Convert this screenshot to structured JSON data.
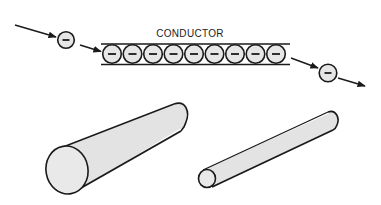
{
  "figure": {
    "label": "CONDUCTOR",
    "colors": {
      "background": "#ffffff",
      "stroke": "#1a1a1a",
      "electron_fill": "#e6e6e6",
      "cylinder_fill": "#e3e3e3",
      "cylinder_end_fill": "#e9e9e9"
    },
    "electron_symbol": "−",
    "electrons": {
      "incoming": {
        "cx": 66,
        "cy": 40,
        "r": 8
      },
      "outgoing": {
        "cx": 328,
        "cy": 73,
        "r": 9
      },
      "in_conductor_count": 9
    },
    "cylinders": [
      {
        "name": "thick-conductor",
        "description": "large diameter conductor"
      },
      {
        "name": "thin-conductor",
        "description": "small diameter conductor"
      }
    ]
  }
}
